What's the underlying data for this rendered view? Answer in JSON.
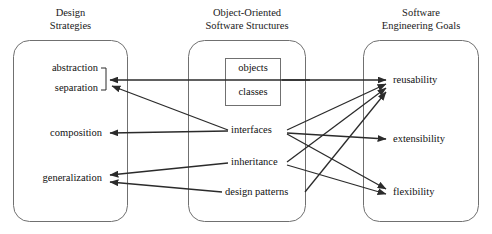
{
  "figure": {
    "background_color": "#ffffff",
    "line_color": "#2b2b2b",
    "text_color": "#111111"
  },
  "columns": [
    {
      "id": "design-strategies",
      "header_line1": "Design",
      "header_line2": "Strategies",
      "items": [
        "abstraction",
        "separation",
        "composition",
        "generalization"
      ]
    },
    {
      "id": "oo-software-structures",
      "header_line1": "Object-Oriented",
      "header_line2": "Software Structures",
      "boxed_items": [
        "objects",
        "classes"
      ],
      "items": [
        "interfaces",
        "inheritance",
        "design patterns"
      ]
    },
    {
      "id": "software-engineering-goals",
      "header_line1": "Software",
      "header_line2": "Engineering Goals",
      "items": [
        "reusability",
        "extensibility",
        "flexibility"
      ]
    }
  ],
  "nodes": {
    "abstraction": "abstraction",
    "separation": "separation",
    "composition": "composition",
    "generalization": "generalization",
    "objects": "objects",
    "classes": "classes",
    "interfaces": "interfaces",
    "inheritance": "inheritance",
    "design_patterns": "design patterns",
    "reusability": "reusability",
    "extensibility": "extensibility",
    "flexibility": "flexibility"
  },
  "edges": [
    {
      "from": "objects-classes",
      "to": "abstraction-separation-bracket"
    },
    {
      "from": "interfaces",
      "to": "abstraction-separation-bracket"
    },
    {
      "from": "interfaces",
      "to": "composition"
    },
    {
      "from": "inheritance",
      "to": "generalization"
    },
    {
      "from": "design patterns",
      "to": "generalization"
    },
    {
      "from": "objects-classes",
      "to": "reusability"
    },
    {
      "from": "interfaces",
      "to": "reusability"
    },
    {
      "from": "inheritance",
      "to": "reusability"
    },
    {
      "from": "design patterns",
      "to": "reusability"
    },
    {
      "from": "interfaces",
      "to": "extensibility"
    },
    {
      "from": "interfaces",
      "to": "flexibility"
    },
    {
      "from": "inheritance",
      "to": "flexibility"
    }
  ]
}
